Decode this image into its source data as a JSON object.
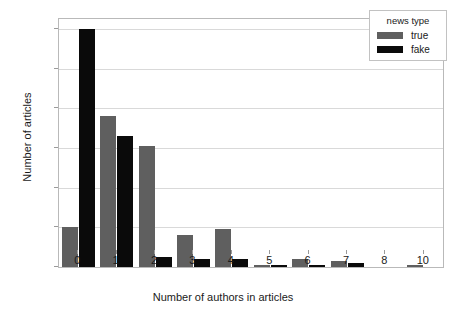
{
  "chart_data": {
    "type": "bar",
    "title": "",
    "xlabel": "Number of authors in articles",
    "ylabel": "Number of articles",
    "categories": [
      "0",
      "1",
      "2",
      "3",
      "4",
      "5",
      "6",
      "7",
      "8",
      "10"
    ],
    "series": [
      {
        "name": "true",
        "color": "#5f5f5f",
        "values": [
          20,
          76,
          61,
          16,
          19,
          1,
          4,
          3,
          0,
          1
        ]
      },
      {
        "name": "fake",
        "color": "#0a0a0a",
        "values": [
          120,
          66,
          5,
          4,
          4,
          1,
          1,
          2,
          0,
          0
        ]
      }
    ],
    "ylim": [
      0,
      125
    ],
    "yticks": [
      0,
      20,
      40,
      60,
      80,
      100,
      120
    ],
    "ytick_labels": [
      "0",
      "20",
      "40",
      "60",
      "80",
      "100",
      "120"
    ],
    "grid": true,
    "legend": {
      "title": "news type",
      "position": "top-right",
      "entries": [
        "true",
        "fake"
      ]
    }
  }
}
